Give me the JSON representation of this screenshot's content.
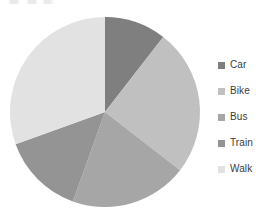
{
  "chart_data": {
    "type": "pie",
    "title": "",
    "xlabel": "",
    "ylabel": "",
    "legend_position": "right",
    "grid": false,
    "start_angle_deg": 0,
    "direction": "clockwise",
    "categories": [
      "Car",
      "Bike",
      "Bus",
      "Train",
      "Walk"
    ],
    "values": [
      10.5,
      25.0,
      20.0,
      14.0,
      30.5
    ],
    "value_unit": "percent",
    "colors": [
      "#7f7f7f",
      "#c0c0c0",
      "#a6a6a6",
      "#949494",
      "#e2e2e2"
    ],
    "slices": [
      {
        "label": "Car",
        "value": 10.5,
        "color": "#7f7f7f",
        "start_deg": 0.0,
        "end_deg": 37.8
      },
      {
        "label": "Bike",
        "value": 25.0,
        "color": "#c0c0c0",
        "start_deg": 37.8,
        "end_deg": 127.8
      },
      {
        "label": "Bus",
        "value": 20.0,
        "color": "#a6a6a6",
        "start_deg": 127.8,
        "end_deg": 199.8
      },
      {
        "label": "Train",
        "value": 14.0,
        "color": "#949494",
        "start_deg": 199.8,
        "end_deg": 250.2
      },
      {
        "label": "Walk",
        "value": 30.5,
        "color": "#e2e2e2",
        "start_deg": 250.2,
        "end_deg": 360.0
      }
    ],
    "geometry": {
      "center_x": 105,
      "center_y": 112,
      "radius": 95
    }
  },
  "legend": {
    "items": [
      {
        "label": "Car",
        "color": "#7f7f7f"
      },
      {
        "label": "Bike",
        "color": "#c0c0c0"
      },
      {
        "label": "Bus",
        "color": "#a6a6a6"
      },
      {
        "label": "Train",
        "color": "#949494"
      },
      {
        "label": "Walk",
        "color": "#e2e2e2"
      }
    ]
  }
}
